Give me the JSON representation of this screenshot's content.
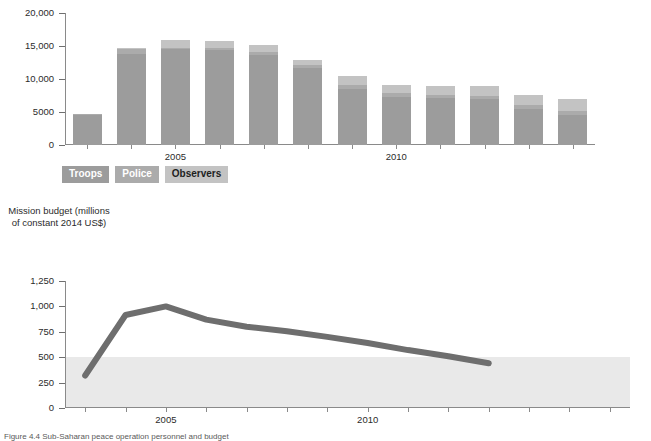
{
  "caption": "Figure 4.4 Sub-Saharan peace operation personnel and budget",
  "bar_chart": {
    "legend": [
      {
        "label": "Troops",
        "color": "#9c9c9c",
        "key": "troops"
      },
      {
        "label": "Police",
        "color": "#ababab",
        "key": "police"
      },
      {
        "label": "Observers",
        "color": "#c3c3c3",
        "key": "observers"
      }
    ],
    "y_ticks": [
      "0",
      "5000",
      "10,000",
      "15,000",
      "20,000"
    ],
    "x_tick_labels": [
      "2005",
      "2010"
    ]
  },
  "line_chart": {
    "axis_title": "Mission budget (millions of constant 2014 US$)",
    "y_ticks": [
      "0",
      "250",
      "500",
      "750",
      "1,000",
      "1,250"
    ],
    "x_tick_labels": [
      "2005",
      "2010"
    ]
  },
  "chart_data": [
    {
      "type": "bar",
      "title": "",
      "subtitle": "",
      "stacked": true,
      "xlabel": "",
      "ylabel": "",
      "ylim": [
        0,
        20000
      ],
      "ytick_values": [
        0,
        5000,
        10000,
        15000,
        20000
      ],
      "grid": false,
      "legend_position": "below-left",
      "categories": [
        "2003",
        "2004",
        "2005",
        "2006",
        "2007",
        "2008",
        "2009",
        "2010",
        "2011",
        "2012",
        "2013",
        "2014"
      ],
      "xtick_labeled": {
        "2005": "2005",
        "2010": "2010"
      },
      "series": [
        {
          "name": "Troops",
          "color": "#9c9c9c",
          "values": [
            4500,
            13750,
            14500,
            14400,
            13650,
            11600,
            8550,
            7350,
            7100,
            6900,
            5400,
            4600
          ]
        },
        {
          "name": "Police",
          "color": "#ababab",
          "values": [
            200,
            850,
            200,
            250,
            400,
            450,
            600,
            500,
            550,
            500,
            600,
            600
          ]
        },
        {
          "name": "Observers",
          "color": "#c3c3c3",
          "values": [
            60,
            120,
            1250,
            1100,
            1050,
            850,
            1250,
            1250,
            1350,
            1600,
            1650,
            1700
          ]
        }
      ],
      "totals": [
        4760,
        14720,
        15950,
        15750,
        15100,
        12900,
        10400,
        9100,
        9000,
        9000,
        7650,
        6900
      ]
    },
    {
      "type": "line",
      "title": "",
      "xlabel": "",
      "ylabel": "Mission budget (millions of constant 2014 US$)",
      "ylim": [
        0,
        1250
      ],
      "ytick_values": [
        0,
        250,
        500,
        750,
        1000,
        1250
      ],
      "grid": false,
      "legend_position": "none",
      "line_color": "#6e6e6e",
      "line_width": 6,
      "shaded_band": {
        "from": 0,
        "to": 500,
        "color": "#e9e9e9",
        "extends_past_line": true
      },
      "x": [
        2003,
        2004,
        2005,
        2006,
        2007,
        2008,
        2009,
        2010,
        2011,
        2012,
        2013
      ],
      "xtick_labeled": {
        "2005": "2005",
        "2010": "2010"
      },
      "values": [
        320,
        915,
        1000,
        870,
        800,
        755,
        700,
        640,
        570,
        510,
        440
      ]
    }
  ]
}
